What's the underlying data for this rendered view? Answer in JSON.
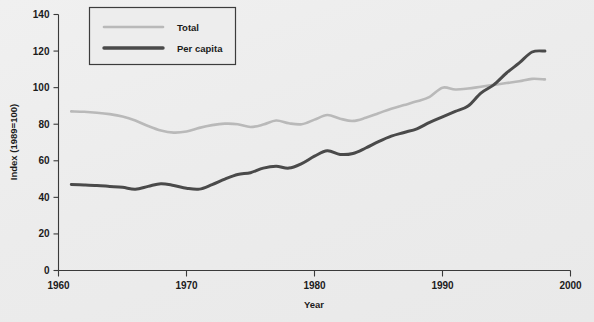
{
  "chart_data": {
    "type": "line",
    "title": "",
    "xlabel": "Year",
    "ylabel": "Index (1989=100)",
    "xlim": [
      1960,
      2000
    ],
    "ylim": [
      0,
      140
    ],
    "xticks": [
      1960,
      1970,
      1980,
      1990,
      2000
    ],
    "xtick_labels": [
      "1960",
      "1970",
      "1980",
      "1990",
      "2000"
    ],
    "yticks": [
      0,
      20,
      40,
      60,
      80,
      100,
      120,
      140
    ],
    "ytick_labels": [
      "0",
      "20",
      "40",
      "60",
      "80",
      "100",
      "120",
      "140"
    ],
    "grid": false,
    "legend_position": "top-left",
    "series": [
      {
        "name": "Total",
        "color": "#b9b9b9",
        "line_width": 2.6,
        "x": [
          1961,
          1962,
          1963,
          1964,
          1965,
          1966,
          1967,
          1968,
          1969,
          1970,
          1971,
          1972,
          1973,
          1974,
          1975,
          1976,
          1977,
          1978,
          1979,
          1980,
          1981,
          1982,
          1983,
          1984,
          1985,
          1986,
          1987,
          1988,
          1989,
          1990,
          1991,
          1992,
          1993,
          1994,
          1995,
          1996,
          1997,
          1998
        ],
        "values": [
          87.0,
          86.8,
          86.3,
          85.5,
          84.2,
          82.0,
          79.0,
          76.5,
          75.4,
          76.0,
          78.0,
          79.5,
          80.3,
          80.0,
          78.5,
          79.8,
          82.0,
          80.5,
          80.0,
          82.5,
          85.0,
          83.0,
          81.8,
          83.5,
          86.0,
          88.5,
          90.5,
          92.5,
          95.0,
          100.0,
          99.0,
          99.5,
          100.5,
          101.5,
          102.5,
          103.5,
          104.8,
          104.5
        ]
      },
      {
        "name": "Per capita",
        "color": "#4a4a4a",
        "line_width": 3.0,
        "x": [
          1961,
          1962,
          1963,
          1964,
          1965,
          1966,
          1967,
          1968,
          1969,
          1970,
          1971,
          1972,
          1973,
          1974,
          1975,
          1976,
          1977,
          1978,
          1979,
          1980,
          1981,
          1982,
          1983,
          1984,
          1985,
          1986,
          1987,
          1988,
          1989,
          1990,
          1991,
          1992,
          1993,
          1994,
          1995,
          1996,
          1997,
          1998
        ],
        "values": [
          47.0,
          46.8,
          46.5,
          46.0,
          45.5,
          44.5,
          46.0,
          47.5,
          46.5,
          45.0,
          44.5,
          47.0,
          50.0,
          52.5,
          53.5,
          56.0,
          57.0,
          56.0,
          58.5,
          62.5,
          65.5,
          63.5,
          64.0,
          67.0,
          70.5,
          73.5,
          75.5,
          77.5,
          81.0,
          84.0,
          87.0,
          90.0,
          97.0,
          101.5,
          108.0,
          113.5,
          119.5,
          120.0
        ]
      }
    ]
  },
  "legend": {
    "items": [
      {
        "label": "Total"
      },
      {
        "label": "Per capita"
      }
    ]
  },
  "axes": {
    "y_title": "Index (1989=100)",
    "x_title": "Year"
  }
}
